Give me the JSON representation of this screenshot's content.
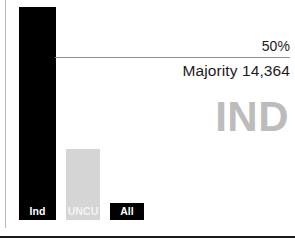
{
  "chart_data": {
    "type": "bar",
    "title": "",
    "subtitle": "",
    "xlabel": "",
    "ylabel": "",
    "categories": [
      "Ind",
      "UNCU",
      "All"
    ],
    "values": [
      86,
      24,
      0
    ],
    "ylim": [
      0,
      100
    ],
    "grid": false,
    "legend_position": "none",
    "series": [
      {
        "name": "Share of vote (%)",
        "values": [
          86,
          24,
          0
        ]
      }
    ],
    "bars": [
      {
        "label": "Ind",
        "value": 86,
        "color": "#000000",
        "label_color": "#ffffff",
        "label_bg": "#000000"
      },
      {
        "label": "UNCU",
        "value": 24,
        "color": "#d5d5d5",
        "label_color": "#f4f4f4",
        "label_bg": "#d5d5d5"
      },
      {
        "label": "All",
        "value": 0,
        "color": "#000000",
        "label_color": "#ffffff",
        "label_bg": "#000000"
      }
    ],
    "threshold": {
      "label": "50%",
      "value": 50,
      "line_color": "#8f8f8f"
    },
    "annotations": [
      {
        "name": "majority",
        "text": "Majority 14,364"
      },
      {
        "name": "winner-watermark",
        "text": "IND"
      }
    ]
  },
  "chart": {
    "threshold_label": "50%",
    "majority_text": "Majority 14,364",
    "watermark_text": "IND",
    "bar_labels": {
      "ind": "Ind",
      "uncut": "UNCU",
      "all": "All"
    }
  },
  "colors": {
    "bar_dark": "#000000",
    "bar_light": "#d5d5d5",
    "threshold_line": "#8f8f8f",
    "watermark": "#bcbcbc",
    "text": "#1b1b1b",
    "frame_rule": "#b9b9b9",
    "bottom_rule": "#1a1a1a"
  }
}
